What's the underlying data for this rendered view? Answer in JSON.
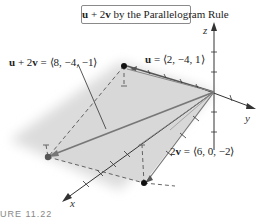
{
  "title": {
    "vector_expr_bold_u": "u",
    "vector_expr_rest1": " + 2",
    "vector_expr_bold_v": "v",
    "vector_expr_rest2": " by the Parallelogram Rule"
  },
  "labels": {
    "sum": {
      "bold_u": "u",
      "plus": " + 2",
      "bold_v": "v",
      "value": " = ⟨8, −4, −1⟩"
    },
    "u": {
      "bold_u": "u",
      "value": " = ⟨2, −4, 1⟩"
    },
    "two_v": {
      "two": "2",
      "bold_v": "v",
      "value": " = ⟨6, 0, −2⟩"
    }
  },
  "axes": {
    "x": "x",
    "y": "y",
    "z": "z"
  },
  "caption": "URE 11.22",
  "colors": {
    "plane_fill": "#d9d9d9",
    "vector_line": "#777777",
    "axis_line": "#333333",
    "point": "#111111",
    "sum_point": "#555555"
  }
}
